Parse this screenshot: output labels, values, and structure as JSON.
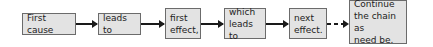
{
  "diagram": {
    "type": "flow-chain",
    "colors": {
      "box_fill": "#e3e3e3",
      "box_border": "#6b6b6b",
      "arrow": "#1a1a1a"
    },
    "nodes": [
      {
        "id": "n1",
        "label": "First cause"
      },
      {
        "id": "n2",
        "label": "leads to"
      },
      {
        "id": "n3",
        "label": "first\neffect,"
      },
      {
        "id": "n4",
        "label": "which\nleads to"
      },
      {
        "id": "n5",
        "label": "next\neffect."
      },
      {
        "id": "n6",
        "label": "Continue\nthe chain as\nneed be."
      }
    ],
    "edges": [
      {
        "from": "n1",
        "to": "n2",
        "style": "solid"
      },
      {
        "from": "n2",
        "to": "n3",
        "style": "solid"
      },
      {
        "from": "n3",
        "to": "n4",
        "style": "solid"
      },
      {
        "from": "n4",
        "to": "n5",
        "style": "solid"
      },
      {
        "from": "n5",
        "to": "n6",
        "style": "dashed"
      }
    ]
  }
}
